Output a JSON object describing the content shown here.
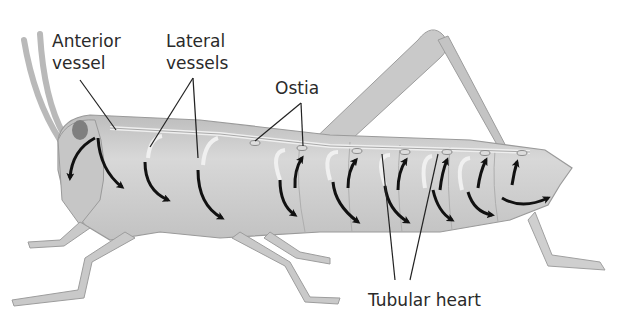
{
  "figure": {
    "labels": {
      "anterior_vessel_line1": "Anterior",
      "anterior_vessel_line2": "vessel",
      "lateral_vessels_line1": "Lateral",
      "lateral_vessels_line2": "vessels",
      "ostia": "Ostia",
      "tubular_heart": "Tubular heart"
    },
    "colors": {
      "body": "#c8c8c8",
      "body_dark": "#a6a6a6",
      "body_light": "#e2e2e2",
      "arrow": "#111111",
      "leader_line": "#222222"
    }
  }
}
